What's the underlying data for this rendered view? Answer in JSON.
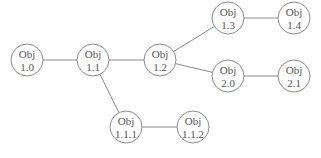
{
  "diagram": {
    "type": "tree",
    "node_radius": 16,
    "colors": {
      "stroke": "#8a8a8a",
      "text": "#555555",
      "background": "#ffffff"
    },
    "nodes": [
      {
        "id": "1.0",
        "line1": "Obj",
        "line2": "1.0",
        "x": 27,
        "y": 60
      },
      {
        "id": "1.1",
        "line1": "Obj",
        "line2": "1.1",
        "x": 93,
        "y": 60
      },
      {
        "id": "1.2",
        "line1": "Obj",
        "line2": "1.2",
        "x": 160,
        "y": 60
      },
      {
        "id": "1.3",
        "line1": "Obj",
        "line2": "1.3",
        "x": 228,
        "y": 18
      },
      {
        "id": "1.4",
        "line1": "Obj",
        "line2": "1.4",
        "x": 294,
        "y": 18
      },
      {
        "id": "2.0",
        "line1": "Obj",
        "line2": "2.0",
        "x": 228,
        "y": 76
      },
      {
        "id": "2.1",
        "line1": "Obj",
        "line2": "2.1",
        "x": 294,
        "y": 76
      },
      {
        "id": "1.1.1",
        "line1": "Obj",
        "line2": "1.1.1",
        "x": 126,
        "y": 127
      },
      {
        "id": "1.1.2",
        "line1": "Obj",
        "line2": "1.1.2",
        "x": 193,
        "y": 127
      }
    ],
    "edges": [
      {
        "from": "1.0",
        "to": "1.1"
      },
      {
        "from": "1.1",
        "to": "1.2"
      },
      {
        "from": "1.2",
        "to": "1.3"
      },
      {
        "from": "1.3",
        "to": "1.4"
      },
      {
        "from": "1.2",
        "to": "2.0"
      },
      {
        "from": "2.0",
        "to": "2.1"
      },
      {
        "from": "1.1",
        "to": "1.1.1"
      },
      {
        "from": "1.1.1",
        "to": "1.1.2"
      }
    ]
  }
}
